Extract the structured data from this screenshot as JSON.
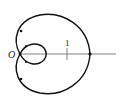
{
  "figure": {
    "type": "polar-curve",
    "curve_name": "limacon-with-inner-loop",
    "origin_label": "O",
    "tick_label": "1",
    "colors": {
      "curve": "#111111",
      "axis": "#555555",
      "background": "#ffffff"
    }
  }
}
